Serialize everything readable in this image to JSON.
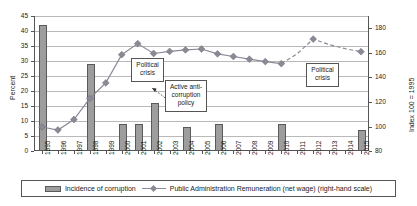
{
  "chart_data": {
    "type": "bar",
    "title": "",
    "xlabel": "",
    "ylabel": "Percent",
    "ylabel_right": "Index 100 = 1995",
    "ylim": [
      0,
      45
    ],
    "ylim_right": [
      80,
      190
    ],
    "yticks": [
      0,
      5,
      10,
      15,
      20,
      25,
      30,
      35,
      40,
      45
    ],
    "yticks_right": [
      80,
      100,
      120,
      140,
      160,
      180
    ],
    "grid": true,
    "legend_position": "bottom",
    "categories": [
      "1995",
      "1996",
      "1997",
      "1998",
      "1999",
      "2000",
      "2001",
      "2002",
      "2003",
      "2004",
      "2005",
      "2006",
      "2007",
      "2008",
      "2009",
      "2010",
      "2011",
      "2012",
      "2013",
      "2014",
      "2015"
    ],
    "series": [
      {
        "name": "Incidence of corruption",
        "type": "bar",
        "axis": "left",
        "unit": "Percent",
        "color": "#9d9d9d",
        "values": [
          42,
          null,
          null,
          29,
          null,
          9,
          9,
          16,
          null,
          8,
          null,
          9,
          null,
          null,
          null,
          9,
          null,
          null,
          null,
          null,
          7
        ]
      },
      {
        "name": "Public Administration Remuneration (net wage) (right-hand scale)",
        "type": "line",
        "axis": "right",
        "unit": "Index 100 = 1995",
        "color": "#8a8a96",
        "values": [
          100,
          96,
          112,
          127,
          148,
          162,
          175,
          172,
          175,
          177,
          178,
          180,
          176,
          173,
          170,
          167,
          176,
          186,
          182,
          178,
          175
        ],
        "values_left_scale": [
          8.0,
          7.0,
          10.5,
          17.5,
          22.7,
          32.1,
          35.8,
          32.5,
          33.2,
          33.7,
          34.0,
          32.4,
          31.5,
          30.6,
          29.8,
          29.1,
          32.4,
          37.3,
          35.5,
          34.1,
          33.1
        ],
        "dashed_from": "2010"
      }
    ],
    "annotations": [
      {
        "id": "political-crisis-1",
        "text_line1": "Political",
        "text_line2": "crisis",
        "near_year": "1999"
      },
      {
        "id": "active-anti-corruption-policy",
        "text_line1": "Active anti-",
        "text_line2": "corruption",
        "text_line3": "policy",
        "near_year": "2002"
      },
      {
        "id": "political-crisis-2",
        "text_line1": "Political",
        "text_line2": "crisis",
        "near_year": "2011"
      }
    ]
  },
  "legend": {
    "bar_label": "Incidence of corruption",
    "line_label": "Public Administration Remuneration (net wage) (right-hand scale)"
  },
  "axes": {
    "left_title": "Percent",
    "right_title": "Index 100 = 1995"
  }
}
